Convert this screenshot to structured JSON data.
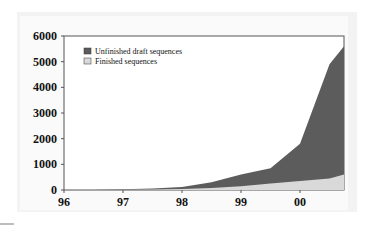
{
  "chart_data": {
    "type": "area",
    "stacked": true,
    "title": "",
    "xlabel": "",
    "ylabel": "",
    "x_tick_labels": [
      "96",
      "97",
      "98",
      "99",
      "00"
    ],
    "y_tick_labels": [
      "0",
      "1000",
      "2000",
      "3000",
      "4000",
      "5000",
      "6000"
    ],
    "ylim": [
      0,
      6000
    ],
    "x": [
      96.0,
      96.5,
      97.0,
      97.5,
      98.0,
      98.5,
      99.0,
      99.5,
      100.0,
      100.5,
      100.75
    ],
    "series": [
      {
        "name": "Finished sequences",
        "color": "#d9d9d9",
        "values": [
          0,
          0,
          10,
          20,
          40,
          80,
          150,
          250,
          350,
          450,
          600
        ]
      },
      {
        "name": "Unfinished draft sequences",
        "color": "#5c5c5c",
        "values": [
          0,
          0,
          20,
          40,
          80,
          220,
          450,
          600,
          1450,
          4450,
          5000
        ]
      }
    ],
    "totals": [
      0,
      0,
      30,
      60,
      120,
      300,
      600,
      850,
      1800,
      4900,
      5600
    ],
    "legend": {
      "position": "upper-left",
      "entries": [
        "Unfinished draft sequences",
        "Finished sequences"
      ]
    },
    "grid": false
  },
  "legend": {
    "items": [
      {
        "label": "Unfinished draft sequences",
        "color": "#5c5c5c"
      },
      {
        "label": "Finished sequences",
        "color": "#d9d9d9"
      }
    ]
  },
  "axes": {
    "y": [
      "6000",
      "5000",
      "4000",
      "3000",
      "2000",
      "1000",
      "0"
    ],
    "x": [
      "96",
      "97",
      "98",
      "99",
      "00"
    ]
  }
}
